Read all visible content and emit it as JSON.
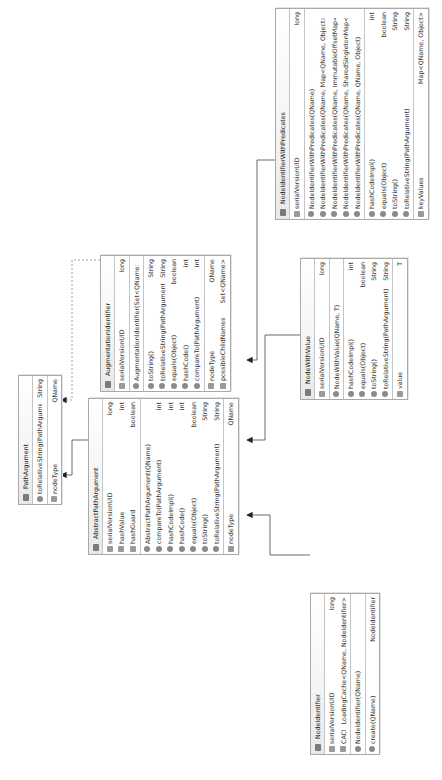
{
  "classes": {
    "path_argument": {
      "name": "PathArgument",
      "sections": [
        [
          {
            "kind": "method",
            "name": "toRelativeString(PathArgument)",
            "type": "String"
          }
        ],
        [
          {
            "kind": "field",
            "name": "nodeType",
            "type": "QName"
          }
        ]
      ]
    },
    "abstract_path_argument": {
      "name": "AbstractPathArgument",
      "sections": [
        [
          {
            "kind": "field",
            "name": "serialVersionUID",
            "type": "long"
          },
          {
            "kind": "field",
            "name": "hashValue",
            "type": "int"
          },
          {
            "kind": "field",
            "name": "hashGuard",
            "type": "boolean"
          }
        ],
        [
          {
            "kind": "method",
            "name": "AbstractPathArgument(QName)",
            "type": ""
          },
          {
            "kind": "method",
            "name": "compareTo(PathArgument)",
            "type": "int"
          },
          {
            "kind": "method",
            "name": "hashCodeImpl()",
            "type": "int"
          },
          {
            "kind": "method",
            "name": "hashCode()",
            "type": "int"
          },
          {
            "kind": "method",
            "name": "equals(Object)",
            "type": "boolean"
          },
          {
            "kind": "method",
            "name": "toString()",
            "type": "String"
          },
          {
            "kind": "method",
            "name": "toRelativeString(PathArgument)",
            "type": "String"
          }
        ],
        [
          {
            "kind": "field",
            "name": "nodeType",
            "type": "QName"
          }
        ]
      ]
    },
    "augmentation_identifier": {
      "name": "AugmentationIdentifier",
      "sections": [
        [
          {
            "kind": "field",
            "name": "serialVersionUID",
            "type": "long"
          }
        ],
        [
          {
            "kind": "method",
            "name": "AugmentationIdentifier(Set<QName>)",
            "type": ""
          }
        ],
        [
          {
            "kind": "method",
            "name": "toString()",
            "type": "String"
          },
          {
            "kind": "method",
            "name": "toRelativeString(PathArgument)",
            "type": "String"
          },
          {
            "kind": "method",
            "name": "equals(Object)",
            "type": "boolean"
          },
          {
            "kind": "method",
            "name": "hashCode()",
            "type": "int"
          },
          {
            "kind": "method",
            "name": "compareTo(PathArgument)",
            "type": "int"
          }
        ],
        [
          {
            "kind": "field",
            "name": "nodeType",
            "type": "QName"
          },
          {
            "kind": "field",
            "name": "possibleChildNames",
            "type": "Set<QName>"
          }
        ]
      ]
    },
    "node_identifier": {
      "name": "NodeIdentifier",
      "sections": [
        [
          {
            "kind": "field",
            "name": "serialVersionUID",
            "type": "long"
          },
          {
            "kind": "field",
            "name": "CACHE",
            "type": "LoadingCache<QName, NodeIdentifier>"
          }
        ],
        [
          {
            "kind": "method",
            "name": "NodeIdentifier(QName)",
            "type": ""
          }
        ],
        [
          {
            "kind": "method",
            "name": "create(QName)",
            "type": "NodeIdentifier"
          }
        ]
      ]
    },
    "node_with_value": {
      "name": "NodeWithValue",
      "sections": [
        [
          {
            "kind": "field",
            "name": "serialVersionUID",
            "type": "long"
          }
        ],
        [
          {
            "kind": "method",
            "name": "NodeWithValue(QName, T)",
            "type": ""
          }
        ],
        [
          {
            "kind": "method",
            "name": "hashCodeImpl()",
            "type": "int"
          },
          {
            "kind": "method",
            "name": "equals(Object)",
            "type": "boolean"
          },
          {
            "kind": "method",
            "name": "toString()",
            "type": "String"
          },
          {
            "kind": "method",
            "name": "toRelativeString(PathArgument)",
            "type": "String"
          }
        ],
        [
          {
            "kind": "field",
            "name": "value",
            "type": "T"
          }
        ]
      ]
    },
    "node_identifier_with_predicates": {
      "name": "NodeIdentifierWithPredicates",
      "sections": [
        [
          {
            "kind": "field",
            "name": "serialVersionUID",
            "type": "long"
          }
        ],
        [
          {
            "kind": "method",
            "name": "NodeIdentifierWithPredicates(QName)",
            "type": ""
          },
          {
            "kind": "method",
            "name": "NodeIdentifierWithPredicates(QName, Map<QName, Object>)",
            "type": ""
          },
          {
            "kind": "method",
            "name": "NodeIdentifierWithPredicates(QName, ImmutableOffsetMap<QName, Object>)",
            "type": ""
          },
          {
            "kind": "method",
            "name": "NodeIdentifierWithPredicates(QName, SharedSingletonMap<QName, Object>)",
            "type": ""
          },
          {
            "kind": "method",
            "name": "NodeIdentifierWithPredicates(QName, QName, Object)",
            "type": ""
          }
        ],
        [
          {
            "kind": "method",
            "name": "hashCodeImpl()",
            "type": "int"
          },
          {
            "kind": "method",
            "name": "equals(Object)",
            "type": "boolean"
          },
          {
            "kind": "method",
            "name": "toString()",
            "type": "String"
          },
          {
            "kind": "method",
            "name": "toRelativeString(PathArgument)",
            "type": "String"
          }
        ],
        [
          {
            "kind": "field",
            "name": "keyValues",
            "type": "Map<QName, Object>"
          }
        ]
      ]
    }
  },
  "relationships": [
    {
      "from": "AbstractPathArgument",
      "to": "PathArgument",
      "style": "implements-solid"
    },
    {
      "from": "AugmentationIdentifier",
      "to": "PathArgument",
      "style": "implements-dashed"
    },
    {
      "from": "NodeIdentifier",
      "to": "AbstractPathArgument",
      "style": "extends"
    },
    {
      "from": "NodeWithValue",
      "to": "AbstractPathArgument",
      "style": "extends"
    },
    {
      "from": "NodeIdentifierWithPredicates",
      "to": "AbstractPathArgument",
      "style": "extends"
    }
  ]
}
